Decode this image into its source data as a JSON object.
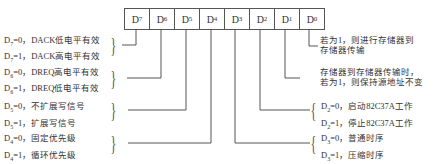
{
  "register": {
    "bits": [
      "7",
      "6",
      "5",
      "4",
      "3",
      "2",
      "1",
      "0"
    ],
    "prefix": "D"
  },
  "left_labels": [
    {
      "bit": "7",
      "lines": [
        {
          "sub": "7",
          "text": "=0，DACK低电平有效"
        },
        {
          "sub": "7",
          "text": "=1，DACK高电平有效"
        }
      ]
    },
    {
      "bit": "6",
      "lines": [
        {
          "sub": "6",
          "text": "=0，DREQ高电平有效"
        },
        {
          "sub": "6",
          "text": "=1，DREQ低电平有效"
        }
      ]
    },
    {
      "bit": "5",
      "lines": [
        {
          "sub": "5",
          "text": "=0，不扩展写信号"
        },
        {
          "sub": "5",
          "text": "=1，扩展写信号"
        }
      ]
    },
    {
      "bit": "4",
      "lines": [
        {
          "sub": "4",
          "text": "=0，固定优先级"
        },
        {
          "sub": "4",
          "text": "=1，循环优先级"
        }
      ]
    }
  ],
  "right_labels": [
    {
      "bit": "0",
      "lines": [
        "若为1，则进行存储器到",
        "存储器传输"
      ]
    },
    {
      "bit": "1",
      "lines": [
        "存储器到存储器传输时，",
        "若为1，则保持源地址不变"
      ]
    },
    {
      "bit": "2",
      "lines": [
        {
          "sub": "2",
          "text": "=0，启动82C37A工作"
        },
        {
          "sub": "2",
          "text": "=1，停止82C37A工作"
        }
      ]
    },
    {
      "bit": "3",
      "lines": [
        {
          "sub": "3",
          "text": "=0，普通时序"
        },
        {
          "sub": "3",
          "text": "=1，压缩时序"
        }
      ]
    }
  ],
  "colors": {
    "line": "#555555",
    "text": "#333333",
    "background": "#ffffff"
  }
}
